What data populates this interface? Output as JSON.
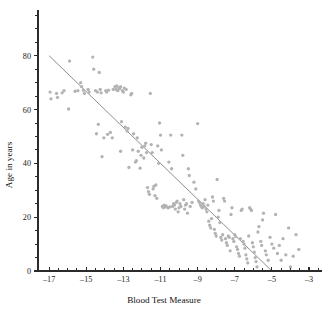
{
  "chart_data": {
    "type": "scatter",
    "title": "",
    "xlabel": "Blood Test Measure",
    "ylabel": "Age in years",
    "xlim": [
      -17.6,
      -2.3
    ],
    "ylim": [
      0,
      97
    ],
    "grid": false,
    "legend": null,
    "x_ticks_major": [
      -17,
      -15,
      -13,
      -11,
      -9,
      -7,
      -5,
      -3
    ],
    "x_tick_labels": [
      "–17",
      "–15",
      "–13",
      "–11",
      "–9",
      "–7",
      "–5",
      "–3"
    ],
    "x_tick_minor_step": 0.5,
    "y_ticks_major": [
      0,
      20,
      40,
      60,
      80
    ],
    "y_tick_labels": [
      "0",
      "20",
      "40",
      "60",
      "80"
    ],
    "y_tick_minor_step": 5,
    "marker": {
      "shape": "circle",
      "color": "#b3b3b3",
      "radius_px": 1.65
    },
    "fit_line": {
      "type": "linear",
      "color": "#8f8f8f",
      "x_start": -17.0,
      "y_start": 80.0,
      "x_end": -5.0,
      "y_end": 0.0,
      "slope": -6.6667,
      "intercept": -33.333
    },
    "n_points": 195,
    "points": [
      [
        -16.95,
        66.5
      ],
      [
        -16.9,
        64.0
      ],
      [
        -16.6,
        66.0
      ],
      [
        -16.55,
        64.5
      ],
      [
        -16.3,
        66.2
      ],
      [
        -16.2,
        67.0
      ],
      [
        -15.9,
        78.0
      ],
      [
        -15.95,
        60.2
      ],
      [
        -15.6,
        66.8
      ],
      [
        -15.45,
        67.0
      ],
      [
        -15.3,
        70.0
      ],
      [
        -15.25,
        68.5
      ],
      [
        -15.15,
        67.2
      ],
      [
        -15.1,
        66.0
      ],
      [
        -14.9,
        67.5
      ],
      [
        -14.85,
        66.5
      ],
      [
        -14.65,
        79.5
      ],
      [
        -14.6,
        75.0
      ],
      [
        -14.5,
        67.0
      ],
      [
        -14.4,
        66.5
      ],
      [
        -14.45,
        51.0
      ],
      [
        -14.35,
        54.5
      ],
      [
        -14.3,
        73.8
      ],
      [
        -14.25,
        67.5
      ],
      [
        -14.2,
        66.2
      ],
      [
        -14.05,
        49.5
      ],
      [
        -14.15,
        42.5
      ],
      [
        -13.95,
        67.0
      ],
      [
        -13.9,
        66.5
      ],
      [
        -13.85,
        50.8
      ],
      [
        -13.8,
        67.2
      ],
      [
        -13.7,
        51.5
      ],
      [
        -13.6,
        49.5
      ],
      [
        -13.55,
        67.5
      ],
      [
        -13.45,
        68.5
      ],
      [
        -13.4,
        67.5
      ],
      [
        -13.35,
        68.8
      ],
      [
        -13.3,
        67.0
      ],
      [
        -13.25,
        68.0
      ],
      [
        -13.2,
        67.8
      ],
      [
        -13.15,
        68.5
      ],
      [
        -13.1,
        55.5
      ],
      [
        -13.05,
        67.0
      ],
      [
        -13.0,
        66.5
      ],
      [
        -13.15,
        44.5
      ],
      [
        -12.95,
        68.0
      ],
      [
        -12.9,
        53.5
      ],
      [
        -12.85,
        67.5
      ],
      [
        -12.8,
        52.0
      ],
      [
        -12.75,
        53.0
      ],
      [
        -12.7,
        38.5
      ],
      [
        -12.6,
        65.5
      ],
      [
        -12.55,
        66.0
      ],
      [
        -12.5,
        45.0
      ],
      [
        -12.45,
        51.0
      ],
      [
        -12.35,
        40.5
      ],
      [
        -12.3,
        41.0
      ],
      [
        -12.25,
        49.5
      ],
      [
        -12.2,
        44.5
      ],
      [
        -12.1,
        38.2
      ],
      [
        -12.05,
        43.0
      ],
      [
        -12.0,
        46.0
      ],
      [
        -11.9,
        42.0
      ],
      [
        -11.85,
        46.5
      ],
      [
        -11.8,
        47.5
      ],
      [
        -11.75,
        44.0
      ],
      [
        -11.7,
        31.0
      ],
      [
        -11.65,
        29.5
      ],
      [
        -11.6,
        28.5
      ],
      [
        -11.55,
        66.0
      ],
      [
        -11.5,
        47.0
      ],
      [
        -11.45,
        44.0
      ],
      [
        -11.4,
        30.5
      ],
      [
        -11.35,
        31.5
      ],
      [
        -11.3,
        28.0
      ],
      [
        -11.25,
        32.0
      ],
      [
        -11.2,
        27.0
      ],
      [
        -11.15,
        46.5
      ],
      [
        -11.1,
        40.0
      ],
      [
        -11.05,
        55.0
      ],
      [
        -11.0,
        50.5
      ],
      [
        -10.95,
        45.0
      ],
      [
        -10.9,
        24.0
      ],
      [
        -10.85,
        23.5
      ],
      [
        -10.8,
        24.5
      ],
      [
        -10.75,
        23.8
      ],
      [
        -10.7,
        24.2
      ],
      [
        -10.6,
        23.5
      ],
      [
        -10.55,
        40.5
      ],
      [
        -10.5,
        23.8
      ],
      [
        -10.45,
        50.5
      ],
      [
        -10.4,
        38.0
      ],
      [
        -10.35,
        24.0
      ],
      [
        -10.3,
        25.0
      ],
      [
        -10.25,
        24.5
      ],
      [
        -10.2,
        23.0
      ],
      [
        -10.15,
        25.5
      ],
      [
        -10.1,
        26.0
      ],
      [
        -10.05,
        22.0
      ],
      [
        -10.0,
        23.5
      ],
      [
        -9.95,
        25.0
      ],
      [
        -9.9,
        24.0
      ],
      [
        -9.85,
        50.5
      ],
      [
        -9.8,
        43.0
      ],
      [
        -9.75,
        26.5
      ],
      [
        -9.7,
        23.0
      ],
      [
        -9.65,
        24.5
      ],
      [
        -9.6,
        25.0
      ],
      [
        -9.55,
        21.5
      ],
      [
        -9.5,
        38.0
      ],
      [
        -9.45,
        35.5
      ],
      [
        -9.4,
        24.0
      ],
      [
        -9.3,
        25.5
      ],
      [
        -9.2,
        33.0
      ],
      [
        -9.1,
        30.5
      ],
      [
        -9.0,
        54.8
      ],
      [
        -8.95,
        26.0
      ],
      [
        -8.9,
        25.5
      ],
      [
        -8.85,
        24.5
      ],
      [
        -8.8,
        24.0
      ],
      [
        -8.75,
        23.5
      ],
      [
        -8.7,
        25.0
      ],
      [
        -8.65,
        24.0
      ],
      [
        -8.6,
        26.5
      ],
      [
        -8.55,
        23.0
      ],
      [
        -8.5,
        22.0
      ],
      [
        -8.45,
        24.5
      ],
      [
        -8.4,
        18.5
      ],
      [
        -8.35,
        17.0
      ],
      [
        -8.3,
        16.0
      ],
      [
        -8.25,
        19.5
      ],
      [
        -8.2,
        27.5
      ],
      [
        -8.15,
        26.0
      ],
      [
        -8.1,
        15.5
      ],
      [
        -8.05,
        14.0
      ],
      [
        -8.0,
        13.0
      ],
      [
        -7.95,
        34.0
      ],
      [
        -7.9,
        20.0
      ],
      [
        -7.85,
        22.5
      ],
      [
        -7.8,
        18.0
      ],
      [
        -7.75,
        12.5
      ],
      [
        -7.7,
        11.5
      ],
      [
        -7.65,
        13.5
      ],
      [
        -7.6,
        27.0
      ],
      [
        -7.55,
        26.0
      ],
      [
        -7.5,
        12.0
      ],
      [
        -7.45,
        10.5
      ],
      [
        -7.4,
        9.5
      ],
      [
        -7.35,
        13.0
      ],
      [
        -7.3,
        12.5
      ],
      [
        -7.25,
        7.5
      ],
      [
        -7.2,
        21.0
      ],
      [
        -7.15,
        23.5
      ],
      [
        -7.1,
        12.0
      ],
      [
        -7.05,
        11.0
      ],
      [
        -7.0,
        13.5
      ],
      [
        -6.95,
        12.8
      ],
      [
        -6.9,
        9.0
      ],
      [
        -6.85,
        8.0
      ],
      [
        -6.8,
        6.5
      ],
      [
        -6.75,
        5.5
      ],
      [
        -6.7,
        12.0
      ],
      [
        -6.65,
        22.5
      ],
      [
        -6.6,
        23.0
      ],
      [
        -6.55,
        11.0
      ],
      [
        -6.5,
        10.0
      ],
      [
        -6.45,
        8.5
      ],
      [
        -6.4,
        6.0
      ],
      [
        -6.35,
        4.5
      ],
      [
        -6.3,
        3.0
      ],
      [
        -6.25,
        13.0
      ],
      [
        -6.2,
        23.5
      ],
      [
        -6.15,
        23.0
      ],
      [
        -6.1,
        22.5
      ],
      [
        -6.05,
        10.5
      ],
      [
        -6.0,
        9.0
      ],
      [
        -5.95,
        7.0
      ],
      [
        -5.9,
        5.0
      ],
      [
        -5.85,
        3.5
      ],
      [
        -5.8,
        1.5
      ],
      [
        -5.75,
        14.5
      ],
      [
        -5.7,
        16.5
      ],
      [
        -5.6,
        11.0
      ],
      [
        -5.55,
        9.5
      ],
      [
        -5.5,
        19.0
      ],
      [
        -5.45,
        21.5
      ],
      [
        -5.35,
        7.5
      ],
      [
        -5.3,
        6.0
      ],
      [
        -5.2,
        4.0
      ],
      [
        -5.1,
        12.5
      ],
      [
        -5.0,
        10.0
      ],
      [
        -4.9,
        8.5
      ],
      [
        -4.8,
        21.0
      ],
      [
        -4.7,
        6.5
      ],
      [
        -4.6,
        9.5
      ],
      [
        -4.5,
        4.0
      ],
      [
        -4.4,
        12.0
      ],
      [
        -4.25,
        6.0
      ],
      [
        -4.1,
        16.0
      ],
      [
        -4.0,
        1.5
      ],
      [
        -3.85,
        5.5
      ],
      [
        -3.7,
        13.5
      ],
      [
        -3.55,
        8.0
      ]
    ]
  },
  "axes": {
    "x_axis_name": "x-axis",
    "y_axis_name": "y-axis"
  }
}
